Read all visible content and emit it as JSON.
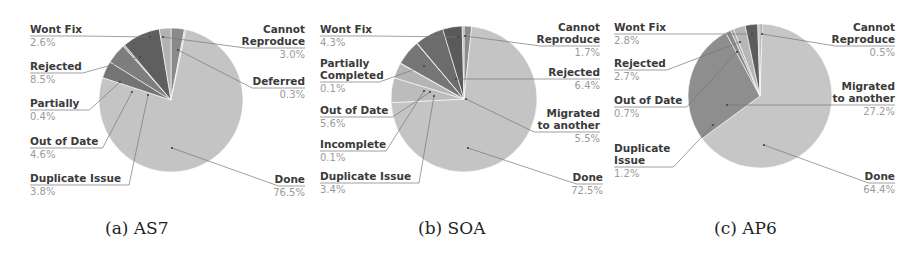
{
  "figure": {
    "captions": [
      "(a) AS7",
      "(b) SOA",
      "(c) AP6"
    ]
  },
  "chart_data": [
    {
      "type": "pie",
      "title": "(a) AS7",
      "center": [
        171,
        100
      ],
      "radius": 72,
      "slices": [
        {
          "label": "Cannot Reproduce",
          "value": 3.0,
          "color": "#8a8a8a"
        },
        {
          "label": "Deferred",
          "value": 0.3,
          "color": "#bdbdbd"
        },
        {
          "label": "Done",
          "value": 76.5,
          "color": "#c4c4c4"
        },
        {
          "label": "Duplicate Issue",
          "value": 3.8,
          "color": "#747474"
        },
        {
          "label": "Out of Date",
          "value": 4.6,
          "color": "#7e7e7e"
        },
        {
          "label": "Partially",
          "value": 0.4,
          "color": "#a9a9a9"
        },
        {
          "label": "Rejected",
          "value": 8.5,
          "color": "#5f5f5f"
        },
        {
          "label": "Wont Fix",
          "value": 2.6,
          "color": "#b2b2b2"
        }
      ],
      "labels": [
        {
          "name": [
            "Wont Fix"
          ],
          "pct": "2.6%",
          "side": "left",
          "x": 30,
          "y": 33,
          "anchor": [
            150,
            37
          ]
        },
        {
          "name": [
            "Rejected"
          ],
          "pct": "8.5%",
          "side": "left",
          "x": 30,
          "y": 70,
          "anchor": [
            140,
            57
          ]
        },
        {
          "name": [
            "Partially"
          ],
          "pct": "0.4%",
          "side": "left",
          "x": 30,
          "y": 107,
          "anchor": [
            120,
            82
          ]
        },
        {
          "name": [
            "Out of Date"
          ],
          "pct": "4.6%",
          "side": "left",
          "x": 30,
          "y": 145,
          "anchor": [
            132,
            92
          ]
        },
        {
          "name": [
            "Duplicate Issue"
          ],
          "pct": "3.8%",
          "side": "left",
          "x": 30,
          "y": 182,
          "anchor": [
            148,
            95
          ]
        },
        {
          "name": [
            "Cannot",
            "Reproduce"
          ],
          "pct": "3.0%",
          "side": "right",
          "x": 305,
          "y": 33,
          "anchor": [
            163,
            37
          ]
        },
        {
          "name": [
            "Deferred"
          ],
          "pct": "0.3%",
          "side": "right",
          "x": 305,
          "y": 85,
          "anchor": [
            178,
            50
          ]
        },
        {
          "name": [
            "Done"
          ],
          "pct": "76.5%",
          "side": "right",
          "x": 305,
          "y": 183,
          "anchor": [
            172,
            148
          ]
        }
      ]
    },
    {
      "type": "pie",
      "title": "(b) SOA",
      "center": [
        464,
        99
      ],
      "radius": 73,
      "slices": [
        {
          "label": "Cannot Reproduce",
          "value": 1.7,
          "color": "#8c8c8c"
        },
        {
          "label": "Done",
          "value": 72.5,
          "color": "#c4c4c4"
        },
        {
          "label": "Migrated to another",
          "value": 5.5,
          "color": "#bcbcbc"
        },
        {
          "label": "Duplicate Issue",
          "value": 3.4,
          "color": "#b4b4b4"
        },
        {
          "label": "Incomplete",
          "value": 0.1,
          "color": "#a0a0a0"
        },
        {
          "label": "Out of Date",
          "value": 5.6,
          "color": "#767676"
        },
        {
          "label": "Partially Completed",
          "value": 0.1,
          "color": "#a4a4a4"
        },
        {
          "label": "Rejected",
          "value": 6.4,
          "color": "#6c6c6c"
        },
        {
          "label": "Wont Fix",
          "value": 4.3,
          "color": "#5a5a5a"
        },
        {
          "label": "Other",
          "value": 0.4,
          "color": "#b0b0b0"
        }
      ],
      "labels": [
        {
          "name": [
            "Wont Fix"
          ],
          "pct": "4.3%",
          "side": "left",
          "x": 320,
          "y": 33,
          "anchor": [
            458,
            37
          ]
        },
        {
          "name": [
            "Partially",
            "Completed"
          ],
          "pct": "0.1%",
          "side": "left",
          "x": 320,
          "y": 67,
          "anchor": [
            424,
            66
          ]
        },
        {
          "name": [
            "Out of Date"
          ],
          "pct": "5.6%",
          "side": "left",
          "x": 320,
          "y": 114,
          "anchor": [
            430,
            92
          ]
        },
        {
          "name": [
            "Incomplete"
          ],
          "pct": "0.1%",
          "side": "left",
          "x": 320,
          "y": 148,
          "anchor": [
            424,
            91
          ]
        },
        {
          "name": [
            "Duplicate Issue"
          ],
          "pct": "3.4%",
          "side": "left",
          "x": 320,
          "y": 180,
          "anchor": [
            434,
            96
          ]
        },
        {
          "name": [
            "Cannot",
            "Reproduce"
          ],
          "pct": "1.7%",
          "side": "right",
          "x": 600,
          "y": 31,
          "anchor": [
            465,
            36
          ]
        },
        {
          "name": [
            "Rejected"
          ],
          "pct": "6.4%",
          "side": "right",
          "x": 600,
          "y": 76,
          "anchor": [
            456,
            79
          ]
        },
        {
          "name": [
            "Migrated",
            "to another"
          ],
          "pct": "5.5%",
          "side": "right",
          "x": 600,
          "y": 117,
          "anchor": [
            466,
            99
          ]
        },
        {
          "name": [
            "Done"
          ],
          "pct": "72.5%",
          "side": "right",
          "x": 603,
          "y": 181,
          "anchor": [
            468,
            148
          ]
        }
      ]
    },
    {
      "type": "pie",
      "title": "(c) AP6",
      "center": [
        760,
        96
      ],
      "radius": 72,
      "slices": [
        {
          "label": "Cannot Reproduce",
          "value": 0.5,
          "color": "#7a7a7a"
        },
        {
          "label": "Done",
          "value": 64.4,
          "color": "#c6c6c6"
        },
        {
          "label": "Migrated to another",
          "value": 27.2,
          "color": "#8e8e8e"
        },
        {
          "label": "Duplicate Issue",
          "value": 1.2,
          "color": "#8a8a8a"
        },
        {
          "label": "Out of Date",
          "value": 0.7,
          "color": "#a8a8a8"
        },
        {
          "label": "Rejected",
          "value": 2.7,
          "color": "#b6b6b6"
        },
        {
          "label": "Wont Fix",
          "value": 2.8,
          "color": "#5c5c5c"
        },
        {
          "label": "Other",
          "value": 0.5,
          "color": "#bdbdbd"
        }
      ],
      "labels": [
        {
          "name": [
            "Wont Fix"
          ],
          "pct": "2.8%",
          "side": "left",
          "x": 614,
          "y": 31,
          "anchor": [
            752,
            34
          ]
        },
        {
          "name": [
            "Rejected"
          ],
          "pct": "2.7%",
          "side": "left",
          "x": 614,
          "y": 67,
          "anchor": [
            740,
            42
          ]
        },
        {
          "name": [
            "Out of Date"
          ],
          "pct": "0.7%",
          "side": "left",
          "x": 614,
          "y": 104,
          "anchor": [
            737,
            52
          ]
        },
        {
          "name": [
            "Duplicate",
            "Issue"
          ],
          "pct": "1.2%",
          "side": "left",
          "x": 614,
          "y": 152,
          "anchor": [
            713,
            125
          ]
        },
        {
          "name": [
            "Cannot",
            "Reproduce"
          ],
          "pct": "0.5%",
          "side": "right",
          "x": 895,
          "y": 31,
          "anchor": [
            762,
            34
          ]
        },
        {
          "name": [
            "Migrated",
            "to another"
          ],
          "pct": "27.2%",
          "side": "right",
          "x": 895,
          "y": 90,
          "anchor": [
            727,
            105
          ]
        },
        {
          "name": [
            "Done"
          ],
          "pct": "64.4%",
          "side": "right",
          "x": 895,
          "y": 180,
          "anchor": [
            764,
            145
          ]
        }
      ]
    }
  ]
}
